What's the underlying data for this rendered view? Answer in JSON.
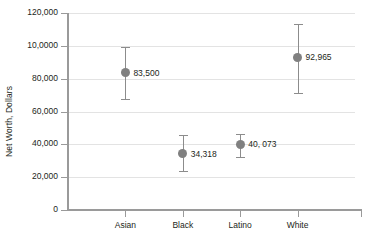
{
  "chart_data": {
    "type": "scatter",
    "title": "",
    "xlabel": "",
    "ylabel": "Net Worth, Dollars",
    "categories": [
      "Asian",
      "Black",
      "Latino",
      "White"
    ],
    "values": [
      83500,
      34318,
      40073,
      92965
    ],
    "value_labels": [
      "83,500",
      "34,318",
      "40, 073",
      "92,965"
    ],
    "error_low": [
      67500,
      23500,
      32500,
      71000
    ],
    "error_high": [
      99000,
      45500,
      46500,
      113500
    ],
    "ylim": [
      0,
      120000
    ],
    "ytick_values": [
      0,
      20000,
      40000,
      60000,
      80000,
      100000,
      120000
    ],
    "ytick_labels": [
      "0",
      "20,000",
      "40,000",
      "60,000",
      "80,000",
      "10,0000",
      "120,000"
    ],
    "grid": true,
    "legend": false,
    "marker_color": "#808080",
    "errorbar_color": "#8c8c8c",
    "gridline_color": "#e3e3e3",
    "axis_color": "#9a9a9a",
    "background_color": "#ffffff"
  }
}
